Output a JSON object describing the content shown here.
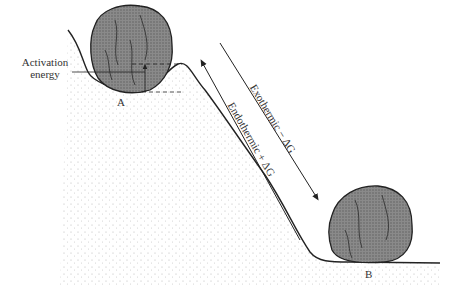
{
  "diagram": {
    "labels": {
      "activation": [
        "Activation",
        "energy"
      ],
      "state_a": "A",
      "state_b": "B",
      "exothermic": "Exothermic − ΔG",
      "endothermic": "Endothermic + ΔG"
    },
    "colors": {
      "ink": "#222222",
      "rock": "#7a7a7a",
      "rock_dark": "#555555",
      "ground_dots": "#999999"
    }
  }
}
